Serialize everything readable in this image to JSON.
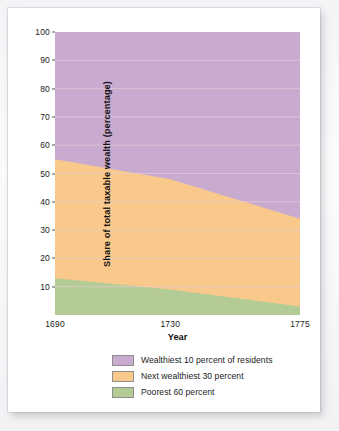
{
  "chart_data": {
    "type": "area",
    "stacked": true,
    "title": "",
    "xlabel": "Year",
    "ylabel": "Share of total taxable wealth (percentage)",
    "xlim": [
      1690,
      1775
    ],
    "ylim": [
      0,
      100
    ],
    "xticks": [
      "1690",
      "1730",
      "1775"
    ],
    "xtick_values": [
      1690,
      1730,
      1775
    ],
    "yticks": [
      "10",
      "20",
      "30",
      "40",
      "50",
      "60",
      "70",
      "80",
      "90",
      "100"
    ],
    "ytick_values": [
      10,
      20,
      30,
      40,
      50,
      60,
      70,
      80,
      90,
      100
    ],
    "grid": "horizontal",
    "grid_color": "#e8cfd8",
    "legend_position": "bottom",
    "x": [
      1690,
      1730,
      1775
    ],
    "series": [
      {
        "name": "Poorest 60 percent",
        "color": "#b3cb95",
        "values": [
          13,
          9,
          3
        ]
      },
      {
        "name": "Next wealthiest 30 percent",
        "color": "#f8c98a",
        "values": [
          42,
          39,
          31
        ]
      },
      {
        "name": "Wealthiest 10 percent of residents",
        "color": "#c9abd0",
        "values": [
          45,
          52,
          66
        ]
      }
    ],
    "cumulative_tops": {
      "poorest_60": [
        13,
        9,
        3
      ],
      "through_next_30": [
        55,
        48,
        34
      ],
      "total": [
        100,
        100,
        100
      ]
    }
  },
  "legend": {
    "items": [
      {
        "label": "Wealthiest 10 percent of residents",
        "color": "#c9abd0"
      },
      {
        "label": "Next wealthiest 30 percent",
        "color": "#f8c98a"
      },
      {
        "label": "Poorest 60 percent",
        "color": "#b3cb95"
      }
    ]
  }
}
